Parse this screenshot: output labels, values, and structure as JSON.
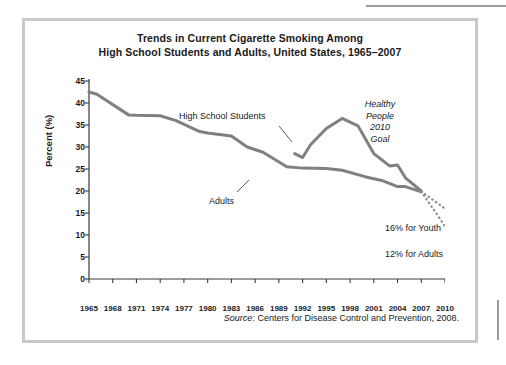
{
  "figure": {
    "title_line_1": "Trends in Current Cigarette Smoking Among",
    "title_line_2": "High School Students and Adults, United States, 1965–2007",
    "source_word": "Source",
    "source_text": ": Centers for Disease Control and Prevention, 2008.",
    "frame_color": "#c9c9c9"
  },
  "annotations": {
    "goal_line_1": "Healthy",
    "goal_line_2": "People",
    "goal_line_3": "2010",
    "goal_line_4": "Goal",
    "youth_goal": "16% for Youth",
    "adults_goal": "12% for Adults"
  },
  "chart_data": {
    "type": "line",
    "title": "Trends in Current Cigarette Smoking Among High School Students and Adults, United States, 1965–2007",
    "xlabel": "Year",
    "ylabel": "Percent (%)",
    "xlim": [
      1965,
      2010
    ],
    "ylim": [
      0,
      45
    ],
    "yticks": [
      0,
      5,
      10,
      15,
      20,
      25,
      30,
      35,
      40,
      45
    ],
    "xticks": [
      1965,
      1968,
      1971,
      1974,
      1977,
      1980,
      1983,
      1986,
      1989,
      1992,
      1995,
      1998,
      2001,
      2004,
      2007,
      2010
    ],
    "xticklabels": [
      "1965",
      "1968",
      "1971",
      "1974",
      "1977",
      "1980",
      "1983",
      "1986",
      "1989",
      "1992",
      "1995",
      "1998",
      "2001",
      "2004",
      "2007",
      "2010"
    ],
    "grid": false,
    "legend": "inline-labels",
    "line_color": "#808080",
    "series": [
      {
        "name": "Adults",
        "label": "Adults",
        "x": [
          1965,
          1966,
          1970,
          1971,
          1974,
          1976,
          1979,
          1980,
          1983,
          1985,
          1987,
          1990,
          1992,
          1995,
          1997,
          2000,
          2002,
          2004,
          2005,
          2007
        ],
        "values": [
          42.5,
          42.0,
          37.3,
          37.2,
          37.1,
          36.0,
          33.5,
          33.2,
          32.5,
          30.0,
          28.8,
          25.5,
          25.2,
          25.1,
          24.7,
          23.2,
          22.4,
          21.0,
          21.0,
          19.8
        ]
      },
      {
        "name": "High School Students",
        "label": "High School Students",
        "x": [
          1991,
          1992,
          1993,
          1995,
          1997,
          1999,
          2001,
          2003,
          2004,
          2005,
          2007
        ],
        "values": [
          28.5,
          27.6,
          30.5,
          34.2,
          36.5,
          34.8,
          28.5,
          25.7,
          25.9,
          23.0,
          20.0
        ]
      }
    ],
    "projections": [
      {
        "name": "Youth goal projection",
        "label": "16% for Youth",
        "style": "dotted",
        "x": [
          2007,
          2010
        ],
        "values": [
          19.9,
          16.0
        ]
      },
      {
        "name": "Adults goal projection",
        "label": "12% for Adults",
        "style": "dotted",
        "x": [
          2007,
          2010
        ],
        "values": [
          19.9,
          12.0
        ]
      }
    ]
  }
}
